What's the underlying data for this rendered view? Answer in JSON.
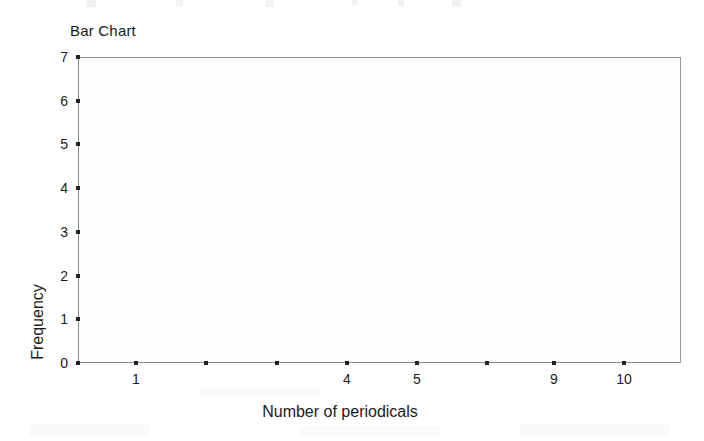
{
  "page": {
    "background_color": "#ffffff",
    "artifact_note": "scanned page with faint cut-off text line at top edge"
  },
  "chart_data": {
    "type": "bar",
    "title": "Bar Chart",
    "xlabel": "Number of periodicals",
    "ylabel": "Frequency",
    "categories": [
      "1",
      "2",
      "3",
      "4",
      "5",
      "6",
      "7",
      "9",
      "10"
    ],
    "tick_labels_shown": [
      "1",
      "",
      "",
      "4",
      "5",
      "",
      "",
      "9",
      "10"
    ],
    "values": [
      0,
      0,
      0,
      0,
      0,
      0,
      0,
      0,
      0
    ],
    "ylim": [
      0,
      7
    ],
    "y_ticks": [
      "0",
      "1",
      "2",
      "3",
      "4",
      "5",
      "6",
      "7"
    ],
    "grid": false,
    "legend": false,
    "frame_color": "#8b8b8b",
    "plot_background": "#fefefe",
    "note": "plot area is empty - no bars rendered"
  },
  "axes": {
    "y": {
      "title": "Frequency",
      "ticks": [
        {
          "label": "7",
          "value": 7
        },
        {
          "label": "6",
          "value": 6
        },
        {
          "label": "5",
          "value": 5
        },
        {
          "label": "4",
          "value": 4
        },
        {
          "label": "3",
          "value": 3
        },
        {
          "label": "2",
          "value": 2
        },
        {
          "label": "1",
          "value": 1
        },
        {
          "label": "0",
          "value": 0
        }
      ]
    },
    "x": {
      "title": "Number of periodicals",
      "ticks": [
        {
          "label": "1",
          "x": 136
        },
        {
          "label": "",
          "x": 206
        },
        {
          "label": "",
          "x": 277
        },
        {
          "label": "4",
          "x": 347
        },
        {
          "label": "5",
          "x": 417
        },
        {
          "label": "",
          "x": 487
        },
        {
          "label": "",
          "x": 554
        },
        {
          "label": "9",
          "x": 554
        },
        {
          "label": "10",
          "x": 624
        }
      ]
    }
  }
}
